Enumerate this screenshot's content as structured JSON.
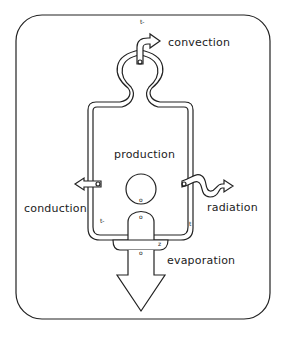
{
  "diagram": {
    "title_mark": "t-",
    "center_label": "production",
    "labels": {
      "convection": "convection",
      "conduction": "conduction",
      "radiation": "radiation",
      "evaporation": "evaporation"
    },
    "small_marks": {
      "left_inner": "t-",
      "right_inner": "t",
      "bottom_right": "z",
      "center_o": "o",
      "lower_o": "o",
      "arrow_o": "o"
    },
    "colors": {
      "stroke": "#222222",
      "background": "#ffffff"
    }
  }
}
